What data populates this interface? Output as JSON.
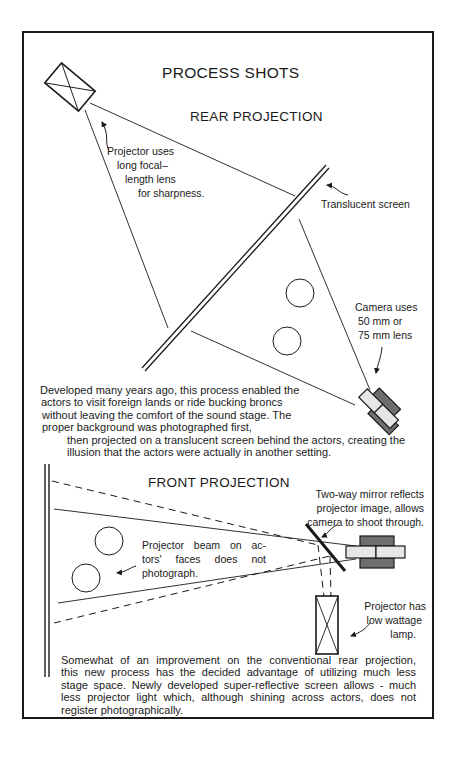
{
  "title": "PROCESS SHOTS",
  "rear": {
    "heading": "REAR PROJECTION",
    "projector_label": [
      "Projector uses",
      "long focal–",
      "length  lens",
      "for  sharpness."
    ],
    "screen_label": "Translucent  screen",
    "camera_label": [
      "Camera uses",
      "50  mm  or",
      "75  mm  lens"
    ],
    "paragraph_lines": [
      "Developed many years ago, this process enabled the",
      "actors to visit foreign lands or ride bucking broncs",
      "without leaving the comfort of the sound stage. The",
      "proper background was photographed first,",
      "then projected on a translucent screen behind the actors, creating the",
      "illusion that the actors were actually in another setting."
    ]
  },
  "front": {
    "heading": "FRONT  PROJECTION",
    "mirror_label": [
      "Two-way mirror reflects",
      "projector image, allows",
      "camera to shoot through."
    ],
    "beam_label": [
      "Projector beam on ac-",
      "tors'  faces  does  not",
      "photograph."
    ],
    "projector_label": [
      "Projector has",
      "low wattage",
      "lamp."
    ],
    "paragraph_lines": [
      "Somewhat of an improvement on the conventional rear projection,",
      "this new process has the decided advantage of utilizing much less",
      "stage space. Newly developed super-reflective screen allows - much",
      "less projector light which, although shining across actors, does not",
      "register photographically."
    ]
  },
  "colors": {
    "ink": "#1a1a1a",
    "camera_dark": "#6e6e6e",
    "camera_light": "#e6e6e6",
    "paper": "#ffffff"
  }
}
